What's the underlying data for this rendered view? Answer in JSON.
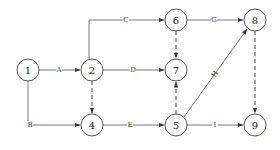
{
  "diagram": {
    "type": "activity-on-arrow network",
    "nodes": [
      {
        "id": "1",
        "label": "1",
        "x": 28,
        "y": 70
      },
      {
        "id": "2",
        "label": "2",
        "x": 92,
        "y": 70
      },
      {
        "id": "4",
        "label": "4",
        "x": 92,
        "y": 125
      },
      {
        "id": "5",
        "label": "5",
        "x": 176,
        "y": 125
      },
      {
        "id": "6",
        "label": "6",
        "x": 176,
        "y": 20
      },
      {
        "id": "7",
        "label": "7",
        "x": 176,
        "y": 70
      },
      {
        "id": "8",
        "label": "8",
        "x": 255,
        "y": 20
      },
      {
        "id": "9",
        "label": "9",
        "x": 255,
        "y": 125
      }
    ],
    "edges": [
      {
        "from": "1",
        "to": "2",
        "label": "A",
        "style": "solid"
      },
      {
        "from": "1",
        "to": "4",
        "label": "B",
        "style": "solid"
      },
      {
        "from": "2",
        "to": "6",
        "label": "C",
        "style": "solid"
      },
      {
        "from": "2",
        "to": "7",
        "label": "D",
        "style": "solid"
      },
      {
        "from": "2",
        "to": "4",
        "label": "",
        "style": "dashed"
      },
      {
        "from": "4",
        "to": "5",
        "label": "E",
        "style": "solid"
      },
      {
        "from": "6",
        "to": "8",
        "label": "G",
        "style": "solid"
      },
      {
        "from": "6",
        "to": "7",
        "label": "",
        "style": "dashed"
      },
      {
        "from": "5",
        "to": "7",
        "label": "",
        "style": "dashed"
      },
      {
        "from": "5",
        "to": "8",
        "label": "H",
        "style": "solid"
      },
      {
        "from": "5",
        "to": "9",
        "label": "I",
        "style": "solid"
      },
      {
        "from": "8",
        "to": "9",
        "label": "",
        "style": "dashed"
      }
    ]
  }
}
